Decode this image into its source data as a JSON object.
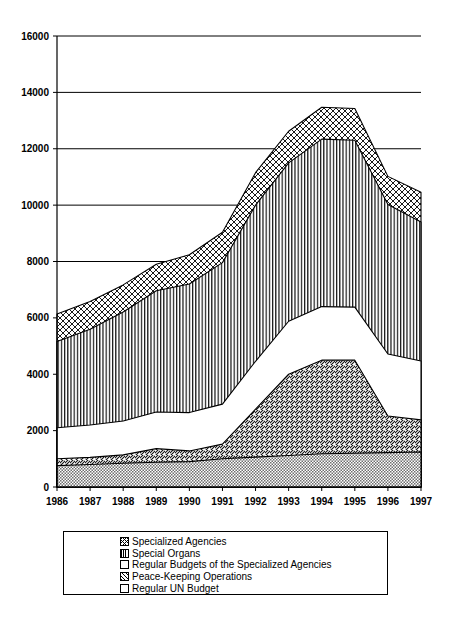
{
  "chart_data": {
    "type": "area",
    "title": "",
    "subtitle": "",
    "xlabel": "",
    "ylabel": "",
    "stacked": true,
    "grid": true,
    "legend_position": "bottom",
    "xlim": [
      1986,
      1997
    ],
    "ylim": [
      0,
      16000
    ],
    "ytick_step": 2000,
    "categories": [
      "1986",
      "1987",
      "1988",
      "1989",
      "1990",
      "1991",
      "1992",
      "1993",
      "1994",
      "1995",
      "1996",
      "1997"
    ],
    "x": [
      1986,
      1987,
      1988,
      1989,
      1990,
      1991,
      1992,
      1993,
      1994,
      1995,
      1996,
      1997
    ],
    "ytick_labels": [
      "0",
      "2000",
      "4000",
      "6000",
      "8000",
      "10000",
      "12000",
      "14000",
      "16000"
    ],
    "ytick_values": [
      0,
      2000,
      4000,
      6000,
      8000,
      10000,
      12000,
      14000,
      16000
    ],
    "series": [
      {
        "name": "Regular UN Budget",
        "fill": "dotted-grey",
        "stack_order": 1,
        "values": [
          760,
          800,
          840,
          880,
          900,
          1000,
          1060,
          1120,
          1180,
          1200,
          1220,
          1240
        ]
      },
      {
        "name": "Peace-Keeping Operations",
        "fill": "diagonal-hatch",
        "stack_order": 2,
        "values": [
          240,
          250,
          300,
          480,
          380,
          520,
          1700,
          2880,
          3320,
          3300,
          1300,
          1140
        ]
      },
      {
        "name": "Regular Budgets of the Specialized Agencies",
        "fill": "white",
        "stack_order": 3,
        "values": [
          1100,
          1150,
          1200,
          1300,
          1360,
          1420,
          1700,
          1880,
          1900,
          1880,
          2200,
          2090
        ]
      },
      {
        "name": "Special Organs",
        "fill": "vertical-lines",
        "stack_order": 4,
        "values": [
          3060,
          3400,
          3870,
          4300,
          4560,
          5020,
          5540,
          5620,
          5940,
          5920,
          5300,
          4930
        ]
      },
      {
        "name": "Specialized Agencies",
        "fill": "cross-hatch",
        "stack_order": 5,
        "values": [
          980,
          980,
          960,
          940,
          1040,
          1080,
          1150,
          1120,
          1130,
          1130,
          1000,
          1060
        ]
      }
    ],
    "stack_tops": {
      "Regular UN Budget": [
        760,
        800,
        840,
        880,
        900,
        1000,
        1060,
        1120,
        1180,
        1200,
        1220,
        1240
      ],
      "Peace-Keeping Operations": [
        1000,
        1050,
        1140,
        1360,
        1280,
        1520,
        2760,
        4000,
        4500,
        4500,
        2520,
        2380
      ],
      "Regular Budgets of the Specialized Agencies": [
        2100,
        2200,
        2340,
        2660,
        2640,
        2940,
        4460,
        5880,
        6400,
        6380,
        4720,
        4470
      ],
      "Special Organs": [
        5160,
        5600,
        6210,
        6960,
        7200,
        7960,
        10000,
        11500,
        12340,
        12300,
        10020,
        9400
      ],
      "Specialized Agencies": [
        6140,
        6580,
        7170,
        7900,
        8240,
        9040,
        11150,
        12620,
        13470,
        13430,
        11020,
        10460
      ]
    },
    "totals": [
      6140,
      6580,
      7170,
      7900,
      8240,
      9040,
      11150,
      12620,
      13470,
      13430,
      11020,
      10460
    ]
  },
  "legend": {
    "items": [
      {
        "label": "Specialized Agencies",
        "swatch": "cross-hatch-swatch"
      },
      {
        "label": "Special Organs",
        "swatch": "vertical-lines-swatch"
      },
      {
        "label": "Regular Budgets of the Specialized Agencies",
        "swatch": "white-swatch"
      },
      {
        "label": "Peace-Keeping Operations",
        "swatch": "diagonal-hatch-swatch"
      },
      {
        "label": "Regular UN Budget",
        "swatch": "dotted-grey-swatch"
      }
    ]
  },
  "colors": {
    "ink": "#000000",
    "paper": "#ffffff",
    "grey_fill": "#b0b0b0"
  }
}
